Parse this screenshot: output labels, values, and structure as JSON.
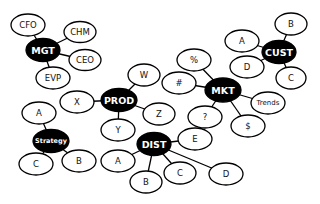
{
  "colors": {
    "hub_fill": "#000000",
    "hub_text": "#ffffff",
    "leaf_fill": "#ffffff",
    "leaf_text": "#111111",
    "edge": "#000000"
  },
  "hubs": [
    {
      "id": "mgt",
      "label": "MGT",
      "children": [
        "CFO",
        "CHM",
        "CEO",
        "EVP"
      ]
    },
    {
      "id": "cust",
      "label": "CUST",
      "children": [
        "A",
        "B",
        "D",
        "C"
      ]
    },
    {
      "id": "mkt",
      "label": "MKT",
      "children": [
        "%",
        "#",
        "Trends",
        "?",
        "$"
      ]
    },
    {
      "id": "prod",
      "label": "PROD",
      "children": [
        "W",
        "X",
        "Z",
        "Y"
      ]
    },
    {
      "id": "strategy",
      "label": "Strategy",
      "children": [
        "A",
        "C",
        "B"
      ]
    },
    {
      "id": "dist",
      "label": "DIST",
      "children": [
        "E",
        "A",
        "B",
        "C",
        "D"
      ]
    }
  ]
}
